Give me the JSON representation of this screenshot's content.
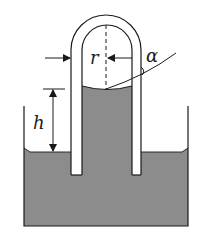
{
  "diagram": {
    "labels": {
      "radius": "r",
      "height": "h",
      "contact_angle": "α"
    },
    "colors": {
      "liquid": "#8c8c8c",
      "stroke": "#1a1a1a",
      "background": "#ffffff"
    },
    "elements": [
      "container",
      "liquid",
      "u-tube",
      "center-dashed-line",
      "radius-arrows",
      "height-arrow",
      "tangent-line",
      "angle-arc"
    ]
  }
}
